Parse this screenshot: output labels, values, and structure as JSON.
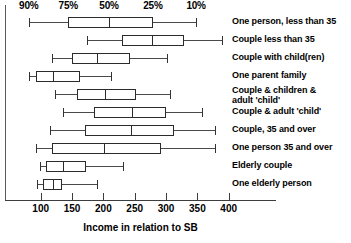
{
  "chart_data": {
    "type": "box",
    "title": "",
    "xlabel": "Income in relation to SB",
    "ylabel": "",
    "xlim": [
      70,
      430
    ],
    "xticks": [
      100,
      150,
      200,
      250,
      300,
      350,
      400
    ],
    "xticklabels": [
      "100",
      "150",
      "200",
      "250",
      "300",
      "350",
      "400"
    ],
    "grid": false,
    "legend": "none",
    "percentile_axis": {
      "labels": [
        "90%",
        "75%",
        "50%",
        "25%",
        "10%"
      ],
      "values": [
        90,
        75,
        50,
        25,
        10
      ],
      "note": "Percentile scale across top, aligned to first box plot row"
    },
    "categories": [
      "One person, less than 35",
      "Couple less than 35",
      "Couple with child(ren)",
      "One parent family",
      "Couple & children &\nadult 'child'",
      "Couple & adult 'child'",
      "Couple, 35 and over",
      "One person 35 and over",
      "Elderly couple",
      "One elderly person"
    ],
    "boxes": [
      {
        "category": "One person, less than 35",
        "min": 81,
        "q1": 144,
        "median": 209,
        "q3": 279,
        "max": 348
      },
      {
        "category": "Couple less than 35",
        "min": 174,
        "q1": 230,
        "median": 278,
        "q3": 329,
        "max": 389
      },
      {
        "category": "Couple with child(ren)",
        "min": 118,
        "q1": 150,
        "median": 190,
        "q3": 243,
        "max": 302
      },
      {
        "category": "One parent family",
        "min": 81,
        "q1": 92,
        "median": 120,
        "q3": 163,
        "max": 212
      },
      {
        "category": "Couple & children & adult 'child'",
        "min": 123,
        "q1": 158,
        "median": 203,
        "q3": 252,
        "max": 306
      },
      {
        "category": "Couple & adult 'child'",
        "min": 136,
        "q1": 185,
        "median": 246,
        "q3": 300,
        "max": 357
      },
      {
        "category": "Couple, 35 and over",
        "min": 115,
        "q1": 171,
        "median": 244,
        "q3": 313,
        "max": 378
      },
      {
        "category": "One person 35 and over",
        "min": 92,
        "q1": 118,
        "median": 201,
        "q3": 292,
        "max": 378
      },
      {
        "category": "Elderly couple",
        "min": 99,
        "q1": 108,
        "median": 136,
        "q3": 172,
        "max": 231
      },
      {
        "category": "One elderly person",
        "min": 94,
        "q1": 104,
        "median": 120,
        "q3": 134,
        "max": 190
      }
    ],
    "colors": {
      "box_stroke": "#2b2b2b",
      "box_fill": "#ffffff",
      "whisker": "#4a4a4a",
      "axis": "#3d3d3d",
      "text": "#000000"
    }
  }
}
